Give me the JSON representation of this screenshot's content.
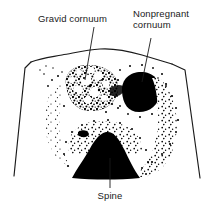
{
  "figure": {
    "background_color": "#ffffff",
    "ink_color": "#000000",
    "outline_color": "#1a1a1a",
    "width": 219,
    "height": 210,
    "labels": {
      "gravid": "Gravid cornuum",
      "nonpregnant": "Nonpregnant\ncornuum",
      "spine": "Spine"
    },
    "structures": [
      {
        "name": "gravid-cornu",
        "label": "Gravid cornuum",
        "appearance": "mottled stippled round mass",
        "center_x": 90,
        "center_y": 92,
        "radius": 27
      },
      {
        "name": "nonpregnant-cornu",
        "label": "Nonpregnant cornuum",
        "appearance": "solid dark round mass",
        "center_x": 140,
        "center_y": 92,
        "radius": 18
      },
      {
        "name": "spine",
        "label": "Spine",
        "appearance": "solid dark mound with stippled halo",
        "center_x": 104,
        "center_y": 160,
        "radius": 26
      }
    ],
    "leaders": [
      {
        "name": "leader-gravid",
        "x1": 94,
        "y1": 27,
        "x2": 85,
        "y2": 80
      },
      {
        "name": "leader-nonpregnant",
        "x1": 151,
        "y1": 38,
        "x2": 142,
        "y2": 82
      },
      {
        "name": "leader-spine",
        "x1": 110,
        "y1": 188,
        "x2": 110,
        "y2": 160
      }
    ]
  }
}
